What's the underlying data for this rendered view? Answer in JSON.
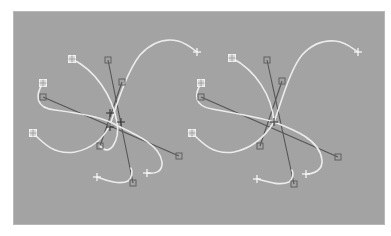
{
  "viewport": {
    "background": "#a3a3a3",
    "curve_color": "#ececec",
    "handle_color": "#555555"
  },
  "diagrams": [
    {
      "name": "left-spline-set",
      "center": [
        110,
        125
      ],
      "knots_square": [
        [
          72,
          59
        ],
        [
          43,
          83
        ],
        [
          33,
          133
        ]
      ],
      "knots_plus": [
        [
          197,
          52
        ],
        [
          97,
          177
        ],
        [
          147,
          173
        ]
      ],
      "handles": [
        [
          108,
          60
        ],
        [
          122,
          82
        ],
        [
          43,
          97
        ],
        [
          100,
          146
        ],
        [
          179,
          156
        ],
        [
          133,
          183
        ]
      ],
      "mid_markers": [
        [
          110,
          113
        ],
        [
          110,
          127
        ],
        [
          121,
          122
        ]
      ]
    },
    {
      "name": "right-spline-set",
      "center": [
        274,
        122
      ],
      "knots_square": [
        [
          232,
          58
        ],
        [
          201,
          83
        ],
        [
          192,
          133
        ]
      ],
      "knots_plus": [
        [
          358,
          52
        ],
        [
          257,
          179
        ],
        [
          306,
          174
        ]
      ],
      "handles": [
        [
          267,
          60
        ],
        [
          282,
          81
        ],
        [
          201,
          97
        ],
        [
          260,
          146
        ],
        [
          338,
          157
        ],
        [
          294,
          184
        ]
      ],
      "mid_markers": [
        [
          274,
          122
        ]
      ]
    }
  ]
}
